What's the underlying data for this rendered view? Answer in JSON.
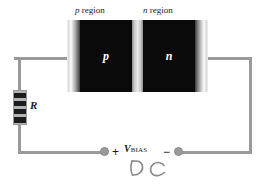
{
  "figure": {
    "type": "circuit-diagram"
  },
  "diode": {
    "p_region_caption_italic": "p",
    "p_region_caption_rest": " region",
    "n_region_caption_italic": "n",
    "n_region_caption_rest": " region",
    "p_label": "p",
    "n_label": "n",
    "junction_name": "depletion region",
    "body_color": "#0a0a0a",
    "contact_color": "#8e8e8e",
    "junction_color": "#e8e8e8"
  },
  "resistor": {
    "label": "R",
    "body_color": "#b4b4b4",
    "band_color": "#1c1c1c",
    "bands": 4
  },
  "source": {
    "label_symbol": "V",
    "label_subscript": "BIAS",
    "plus_sign": "+",
    "minus_sign": "−",
    "annotation": "DC",
    "annotation_style": "handwritten",
    "terminal_color": "#9a9a9a"
  },
  "wires": {
    "color": "#9a9a9a",
    "thickness_px": 3
  }
}
